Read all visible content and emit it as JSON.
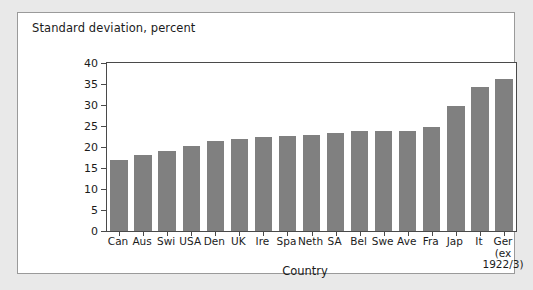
{
  "chart_data": {
    "type": "bar",
    "title": "Standard deviation, percent",
    "xlabel": "Country",
    "ylabel": "Standard deviation, percent",
    "ylim": [
      0,
      40
    ],
    "ytick_step": 5,
    "yticks": [
      0,
      5,
      10,
      15,
      20,
      25,
      30,
      35,
      40
    ],
    "ytick_labels": [
      "0",
      "5",
      "10",
      "15",
      "20",
      "25",
      "30",
      "35",
      "40"
    ],
    "grid": false,
    "legend": null,
    "bar_color": "#808080",
    "categories": [
      "Can",
      "Aus",
      "Swi",
      "USA",
      "Den",
      "UK",
      "Ire",
      "Spa",
      "Neth",
      "SA",
      "Bel",
      "Swe",
      "Ave",
      "Fra",
      "Jap",
      "It",
      "Ger (ex 1922/3)"
    ],
    "category_labels": [
      {
        "line1": "Can"
      },
      {
        "line1": "Aus"
      },
      {
        "line1": "Swi"
      },
      {
        "line1": "USA"
      },
      {
        "line1": "Den"
      },
      {
        "line1": "UK"
      },
      {
        "line1": "Ire"
      },
      {
        "line1": "Spa"
      },
      {
        "line1": "Neth"
      },
      {
        "line1": "SA"
      },
      {
        "line1": "Bel"
      },
      {
        "line1": "Swe"
      },
      {
        "line1": "Ave"
      },
      {
        "line1": "Fra"
      },
      {
        "line1": "Jap"
      },
      {
        "line1": "It"
      },
      {
        "line1": "Ger",
        "line2": "(ex",
        "line3": "1922/3)"
      }
    ],
    "values": [
      16.8,
      18.1,
      19.0,
      20.2,
      21.5,
      21.8,
      22.3,
      22.7,
      22.9,
      23.3,
      23.8,
      23.9,
      23.9,
      24.7,
      29.7,
      34.4,
      36.3
    ]
  },
  "figure": {
    "panel_background": "#ffffff",
    "outer_background": "#e9e9e9",
    "border_color": "#9a9a9a",
    "axis_color": "#4a4a4a"
  }
}
